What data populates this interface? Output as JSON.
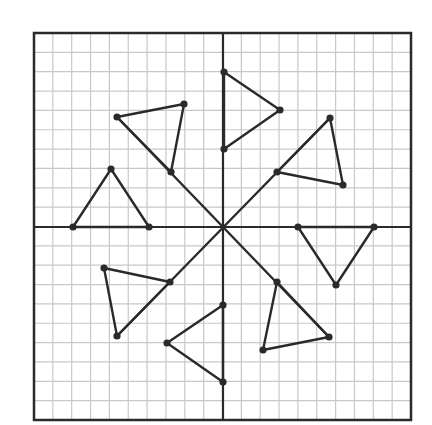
{
  "diagram": {
    "type": "coordinate-grid-rotational-symmetry",
    "grid": {
      "left": 34,
      "top": 33,
      "right": 411,
      "bottom": 420,
      "cols": 20,
      "rows": 20,
      "origin_px": [
        223,
        227
      ],
      "grid_color": "#c8c8c8",
      "axis_color": "#2a2a2a",
      "border_color": "#2a2a2a"
    },
    "line_color": "#2a2a2a",
    "point_color": "#2a2a2a",
    "connectors": [
      {
        "name": "diagonal-nw-se",
        "from": [
          117,
          117
        ],
        "to": [
          329,
          337
        ]
      },
      {
        "name": "diagonal-ne-sw",
        "from": [
          330,
          118
        ],
        "to": [
          117,
          336
        ]
      }
    ],
    "triangles": [
      {
        "name": "triangle-top",
        "points": [
          [
            224,
            72
          ],
          [
            280,
            110
          ],
          [
            224,
            149
          ]
        ]
      },
      {
        "name": "triangle-top-left",
        "points": [
          [
            117,
            117
          ],
          [
            184,
            104
          ],
          [
            171,
            172
          ]
        ]
      },
      {
        "name": "triangle-left",
        "points": [
          [
            73,
            227
          ],
          [
            111,
            169
          ],
          [
            149,
            227
          ]
        ]
      },
      {
        "name": "triangle-bottom-left",
        "points": [
          [
            104,
            268
          ],
          [
            170,
            282
          ],
          [
            117,
            336
          ]
        ]
      },
      {
        "name": "triangle-bottom",
        "points": [
          [
            223,
            305
          ],
          [
            167,
            343
          ],
          [
            223,
            382
          ]
        ]
      },
      {
        "name": "triangle-bottom-right",
        "points": [
          [
            277,
            282
          ],
          [
            329,
            337
          ],
          [
            263,
            350
          ]
        ]
      },
      {
        "name": "triangle-right",
        "points": [
          [
            298,
            227
          ],
          [
            374,
            227
          ],
          [
            336,
            285
          ]
        ]
      },
      {
        "name": "triangle-top-right",
        "points": [
          [
            330,
            118
          ],
          [
            277,
            172
          ],
          [
            343,
            185
          ]
        ]
      }
    ]
  }
}
